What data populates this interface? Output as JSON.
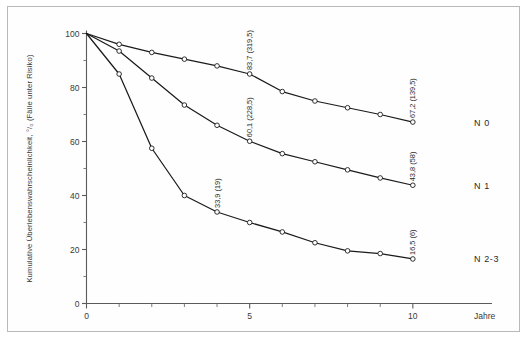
{
  "figure": {
    "border_color": "#b9b9b9",
    "background": "#ffffff",
    "axis_color": "#5a5a5a",
    "curve_color": "#1b1b1b"
  },
  "chart_data": {
    "type": "line",
    "title": "",
    "subtitle": "",
    "xlabel": "Jahre",
    "ylabel": "Kumulative Überlebenswahrscheinlichkeit, °/₀ (Fälle unter Risiko)",
    "xlim": [
      0,
      11.2
    ],
    "ylim": [
      0,
      100
    ],
    "xticks": [
      0,
      1,
      2,
      3,
      4,
      5,
      6,
      7,
      8,
      9,
      10
    ],
    "xtick_labels": [
      "0",
      "",
      "",
      "",
      "",
      "5",
      "",
      "",
      "",
      "",
      "10"
    ],
    "yticks": [
      0,
      10,
      20,
      30,
      40,
      50,
      60,
      70,
      80,
      90,
      100
    ],
    "ytick_labels": [
      "0",
      "",
      "20",
      "",
      "40",
      "",
      "60",
      "",
      "80",
      "",
      "100"
    ],
    "grid": false,
    "legend_position": "right-inline",
    "marker": "open-circle",
    "x": [
      0,
      1,
      2,
      3,
      4,
      5,
      6,
      7,
      8,
      9,
      10
    ],
    "series": [
      {
        "name": "N 0",
        "values": [
          100,
          96.0,
          93.0,
          90.5,
          88.0,
          85.0,
          78.5,
          75.0,
          72.5,
          70.0,
          67.2
        ],
        "annotations": [
          {
            "x": 5,
            "y": 85.0,
            "text": "83,7 (319,5)"
          },
          {
            "x": 10,
            "y": 67.2,
            "text": "67,2 (139,5)"
          }
        ]
      },
      {
        "name": "N 1",
        "values": [
          100,
          93.5,
          83.5,
          73.5,
          66.0,
          60.1,
          55.5,
          52.5,
          49.5,
          46.5,
          43.8
        ],
        "annotations": [
          {
            "x": 5,
            "y": 60.1,
            "text": "60,1 (228,5)"
          },
          {
            "x": 10,
            "y": 43.8,
            "text": "43,8 (58)"
          }
        ]
      },
      {
        "name": "N 2-3",
        "values": [
          100,
          85.0,
          57.5,
          40.0,
          33.9,
          30.0,
          26.5,
          22.5,
          19.5,
          18.5,
          16.5
        ],
        "annotations": [
          {
            "x": 4,
            "y": 33.9,
            "text": "33,9 (19)"
          },
          {
            "x": 10,
            "y": 16.5,
            "text": "16,5 (6)"
          }
        ]
      }
    ],
    "series_labels": [
      {
        "name": "N 0",
        "text": "N 0",
        "y": 67.2
      },
      {
        "name": "N 1",
        "text": "N 1",
        "y": 43.8
      },
      {
        "name": "N 2-3",
        "text": "N 2-3",
        "y": 16.5
      }
    ]
  }
}
